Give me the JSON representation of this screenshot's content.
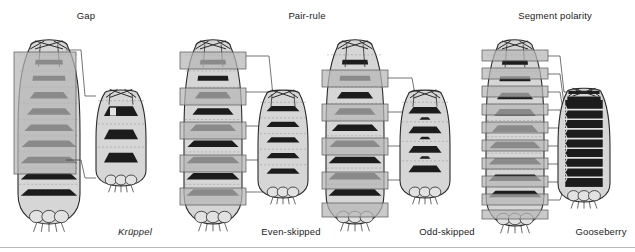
{
  "figure": {
    "title_headers": [
      {
        "id": "gap",
        "label": "Gap",
        "x": 56,
        "y": 10,
        "w": 60
      },
      {
        "id": "pair-rule",
        "label": "Pair-rule",
        "x": 272,
        "y": 10,
        "w": 70
      },
      {
        "id": "segment-polarity",
        "label": "Segment polarity",
        "x": 500,
        "y": 10,
        "w": 110
      }
    ],
    "mutant_labels": [
      {
        "id": "kruppel",
        "label": "Krüppel",
        "italic": true,
        "x": 100,
        "y": 226,
        "w": 70
      },
      {
        "id": "even-skipped",
        "label": "Even-skipped",
        "italic": false,
        "x": 246,
        "y": 226,
        "w": 90
      },
      {
        "id": "odd-skipped",
        "label": "Odd-skipped",
        "italic": false,
        "x": 404,
        "y": 226,
        "w": 86
      },
      {
        "id": "gooseberry",
        "label": "Gooseberry",
        "italic": false,
        "x": 560,
        "y": 226,
        "w": 82
      }
    ],
    "colors": {
      "outline": "#2b2b2b",
      "body_fill": "#d6d6d6",
      "body_fill_light": "#e2e2e2",
      "denticle_dark": "#1c1c1c",
      "overlay_gray": "#b6b6b6",
      "overlay_stroke": "#555555",
      "leader_line": "#3a3a3a",
      "rule": "#b9b9b9",
      "text": "#1b1b1b",
      "page_bg": "#ffffff"
    },
    "panels": [
      {
        "id": "gap",
        "class_name": "Gap",
        "normal": {
          "name": "normal-larva-gap",
          "x": 18,
          "y": 36,
          "w": 62,
          "h": 188,
          "segments": 10,
          "denticle_belts": 9,
          "description": "wild-type larva with ten abdominal denticle belts"
        },
        "overlay": {
          "type": "single-broad-domain",
          "bars": [
            {
              "x": 14,
              "y": 52,
              "w": 62,
              "h": 122
            }
          ],
          "description": "one broad contiguous expression domain spanning several segments"
        },
        "mutant": {
          "name": "mutant-larva-kruppel",
          "x": 96,
          "y": 88,
          "w": 50,
          "h": 98,
          "denticle_belts": 3,
          "description": "severely truncated larva, central segments deleted"
        },
        "leaders": [
          {
            "x1": 66,
            "y1": 50,
            "x2": 96,
            "y2": 96
          },
          {
            "x1": 66,
            "y1": 160,
            "x2": 96,
            "y2": 178
          }
        ]
      },
      {
        "id": "pair-rule-even",
        "class_name": "Pair-rule",
        "normal": {
          "name": "normal-larva-even-skipped",
          "x": 184,
          "y": 36,
          "w": 58,
          "h": 188,
          "segments": 10,
          "denticle_belts": 9,
          "description": "wild-type larva with ten denticle belts"
        },
        "overlay": {
          "type": "alternating-stripes",
          "bars": [
            {
              "x": 180,
              "y": 52,
              "w": 66,
              "h": 17
            },
            {
              "x": 180,
              "y": 88,
              "w": 66,
              "h": 17
            },
            {
              "x": 180,
              "y": 122,
              "w": 66,
              "h": 17
            },
            {
              "x": 180,
              "y": 155,
              "w": 66,
              "h": 17
            },
            {
              "x": 180,
              "y": 188,
              "w": 66,
              "h": 17
            }
          ],
          "description": "five alternating stripes, one per double-segment repeat"
        },
        "mutant": {
          "name": "mutant-larva-even-skipped",
          "x": 258,
          "y": 88,
          "w": 50,
          "h": 110,
          "denticle_belts": 5,
          "description": "every other segment deleted, five remaining belts"
        },
        "leaders": [
          {
            "x1": 246,
            "y1": 56,
            "x2": 292,
            "y2": 96
          },
          {
            "x1": 246,
            "y1": 92,
            "x2": 292,
            "y2": 118
          },
          {
            "x1": 246,
            "y1": 126,
            "x2": 292,
            "y2": 140
          },
          {
            "x1": 246,
            "y1": 160,
            "x2": 292,
            "y2": 162
          },
          {
            "x1": 246,
            "y1": 192,
            "x2": 292,
            "y2": 184
          }
        ]
      },
      {
        "id": "pair-rule-odd",
        "class_name": "Pair-rule",
        "normal": {
          "name": "normal-larva-odd-skipped",
          "x": 326,
          "y": 36,
          "w": 58,
          "h": 188,
          "segments": 10,
          "denticle_belts": 9,
          "description": "wild-type larva with ten denticle belts"
        },
        "overlay": {
          "type": "alternating-stripes",
          "bars": [
            {
              "x": 322,
              "y": 70,
              "w": 66,
              "h": 17
            },
            {
              "x": 322,
              "y": 104,
              "w": 66,
              "h": 17
            },
            {
              "x": 322,
              "y": 138,
              "w": 66,
              "h": 17
            },
            {
              "x": 322,
              "y": 172,
              "w": 66,
              "h": 17
            },
            {
              "x": 322,
              "y": 203,
              "w": 66,
              "h": 14
            }
          ],
          "description": "five alternating stripes offset from even-skipped"
        },
        "mutant": {
          "name": "mutant-larva-odd-skipped",
          "x": 400,
          "y": 88,
          "w": 50,
          "h": 110,
          "denticle_belts": 4,
          "description": "alternate segments deleted, remaining belts fused"
        },
        "leaders": [
          {
            "x1": 388,
            "y1": 78,
            "x2": 436,
            "y2": 100
          },
          {
            "x1": 388,
            "y1": 112,
            "x2": 436,
            "y2": 128
          },
          {
            "x1": 388,
            "y1": 146,
            "x2": 436,
            "y2": 154
          },
          {
            "x1": 388,
            "y1": 180,
            "x2": 436,
            "y2": 178
          }
        ]
      },
      {
        "id": "segment-polarity",
        "class_name": "Segment polarity",
        "normal": {
          "name": "normal-larva-gooseberry",
          "x": 486,
          "y": 36,
          "w": 58,
          "h": 190,
          "segments": 10,
          "denticle_belts": 9,
          "description": "wild-type larva with ten denticle belts"
        },
        "overlay": {
          "type": "per-segment-stripes",
          "bars": [
            {
              "x": 482,
              "y": 50,
              "w": 66,
              "h": 11
            },
            {
              "x": 482,
              "y": 68,
              "w": 66,
              "h": 11
            },
            {
              "x": 482,
              "y": 86,
              "w": 66,
              "h": 11
            },
            {
              "x": 482,
              "y": 104,
              "w": 66,
              "h": 11
            },
            {
              "x": 482,
              "y": 122,
              "w": 66,
              "h": 11
            },
            {
              "x": 482,
              "y": 140,
              "w": 66,
              "h": 11
            },
            {
              "x": 482,
              "y": 158,
              "w": 66,
              "h": 11
            },
            {
              "x": 482,
              "y": 176,
              "w": 66,
              "h": 11
            },
            {
              "x": 482,
              "y": 194,
              "w": 66,
              "h": 11
            },
            {
              "x": 482,
              "y": 210,
              "w": 66,
              "h": 9
            }
          ],
          "description": "one narrow stripe in every segment"
        },
        "mutant": {
          "name": "mutant-larva-gooseberry",
          "x": 558,
          "y": 86,
          "w": 52,
          "h": 116,
          "denticle_belts": 9,
          "description": "polarity reversed; denticles cover whole segment, nearly continuous lawn"
        },
        "leaders": [
          {
            "x1": 548,
            "y1": 56,
            "x2": 572,
            "y2": 92
          },
          {
            "x1": 548,
            "y1": 74,
            "x2": 572,
            "y2": 104
          },
          {
            "x1": 548,
            "y1": 92,
            "x2": 572,
            "y2": 116
          },
          {
            "x1": 548,
            "y1": 110,
            "x2": 572,
            "y2": 128
          },
          {
            "x1": 548,
            "y1": 128,
            "x2": 572,
            "y2": 140
          },
          {
            "x1": 548,
            "y1": 146,
            "x2": 572,
            "y2": 152
          },
          {
            "x1": 548,
            "y1": 164,
            "x2": 572,
            "y2": 164
          },
          {
            "x1": 548,
            "y1": 182,
            "x2": 572,
            "y2": 176
          },
          {
            "x1": 548,
            "y1": 200,
            "x2": 572,
            "y2": 188
          }
        ]
      }
    ]
  }
}
